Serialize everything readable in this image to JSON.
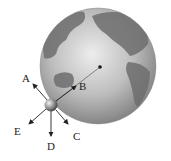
{
  "figure": {
    "vectors": [
      {
        "id": "A",
        "label": "A",
        "direction": "up-left"
      },
      {
        "id": "B",
        "label": "B",
        "direction": "toward Earth center"
      },
      {
        "id": "C",
        "label": "C",
        "direction": "down-right"
      },
      {
        "id": "D",
        "label": "D",
        "direction": "down"
      },
      {
        "id": "E",
        "label": "E",
        "direction": "down-left"
      }
    ],
    "colors": {
      "ocean": "#b8b8b8",
      "land": "#6a6a6a",
      "arrow": "#222222"
    }
  }
}
